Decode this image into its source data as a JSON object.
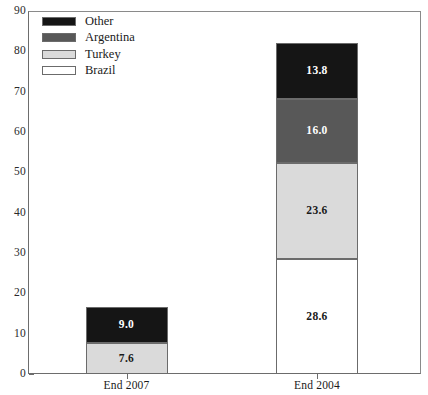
{
  "chart_data": {
    "type": "bar",
    "subtype": "stacked-bar",
    "title": "",
    "xlabel": "",
    "ylabel": "",
    "ylim": [
      0,
      90
    ],
    "ytick_values": [
      0,
      10,
      20,
      30,
      40,
      50,
      60,
      70,
      80,
      90
    ],
    "ytick_labels": [
      "0",
      "10",
      "20",
      "30",
      "40",
      "50",
      "60",
      "70",
      "80",
      "90"
    ],
    "grid": false,
    "legend_position": "top-left",
    "categories": [
      "End 2007",
      "End 2004"
    ],
    "series": [
      {
        "name": "Brazil",
        "color": "#ffffff",
        "values": [
          0.0,
          28.6
        ],
        "labels": [
          "",
          "28.6"
        ]
      },
      {
        "name": "Turkey",
        "color": "#dadada",
        "values": [
          7.6,
          23.6
        ],
        "labels": [
          "7.6",
          "23.6"
        ]
      },
      {
        "name": "Argentina",
        "color": "#585858",
        "values": [
          0.0,
          16.0
        ],
        "labels": [
          "",
          "16.0"
        ]
      },
      {
        "name": "Other",
        "color": "#151515",
        "values": [
          9.0,
          13.8
        ],
        "labels": [
          "9.0",
          "13.8"
        ]
      }
    ],
    "stack_order_bottom_to_top": [
      "Brazil",
      "Turkey",
      "Argentina",
      "Other"
    ],
    "totals": [
      16.6,
      82.0
    ],
    "legend_entries": [
      "Other",
      "Argentina",
      "Turkey",
      "Brazil"
    ],
    "colors": {
      "other": "#151515",
      "argentina": "#585858",
      "turkey": "#dadada",
      "brazil": "#ffffff",
      "axis": "#6d6d6d",
      "outline": "#6b6b6b"
    }
  }
}
